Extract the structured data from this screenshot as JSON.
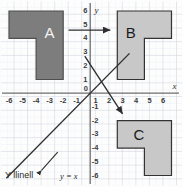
{
  "figure": {
    "width": 183,
    "height": 187
  },
  "colors": {
    "grid_minor": "#e4e8ee",
    "grid_major": "#c9d0d8",
    "axis": "#6e6e6e",
    "shape_a_fill": "#7d7d7d",
    "shape_a_stroke": "#4f4f4f",
    "shape_bc_fill": "#c8c8c8",
    "shape_bc_stroke": "#333333",
    "arrow": "#2e2e2e",
    "line_yx": "#2e2e2e",
    "text": "#2b2b2b",
    "background": "#fdfdfd"
  },
  "axes": {
    "x_label": "x",
    "y_label": "y",
    "x_ticks": [
      "-6",
      "-5",
      "-4",
      "-3",
      "-2",
      "-1",
      "0",
      "1",
      "2",
      "3",
      "4",
      "5",
      "6"
    ],
    "y_ticks": [
      "6",
      "5",
      "4",
      "3",
      "2",
      "1",
      "0",
      "-1",
      "-2",
      "-3",
      "-4",
      "-5",
      "-6"
    ],
    "x_range": [
      -6.6,
      6.6
    ],
    "y_range": [
      -6.6,
      6.6
    ],
    "origin_label": "0",
    "grid": true
  },
  "shapes": [
    {
      "label": "A",
      "name": "shape-a",
      "fill": "dark",
      "label_color": "light",
      "label_at": [
        -3.0,
        4.6
      ],
      "points": [
        [
          -6,
          6
        ],
        [
          -2,
          6
        ],
        [
          -2,
          1
        ],
        [
          -4,
          1
        ],
        [
          -4,
          4
        ],
        [
          -6,
          4
        ]
      ]
    },
    {
      "label": "B",
      "name": "shape-b",
      "fill": "light",
      "label_color": "dark",
      "label_at": [
        3.0,
        4.6
      ],
      "points": [
        [
          2,
          6
        ],
        [
          6,
          6
        ],
        [
          6,
          4
        ],
        [
          4,
          4
        ],
        [
          4,
          1
        ],
        [
          2,
          1
        ]
      ]
    },
    {
      "label": "C",
      "name": "shape-c",
      "fill": "light",
      "label_color": "dark",
      "label_at": [
        3.6,
        -3.0
      ],
      "points": [
        [
          2,
          -2
        ],
        [
          6,
          -2
        ],
        [
          6,
          -6
        ],
        [
          4,
          -6
        ],
        [
          4,
          -4
        ],
        [
          2,
          -4
        ]
      ]
    }
  ],
  "arrows": [
    {
      "name": "translation-arrow",
      "from": [
        -1.6,
        4.6
      ],
      "to": [
        1.6,
        4.6
      ]
    },
    {
      "name": "reflection-arrow",
      "from": [
        -0.4,
        2.7
      ],
      "to": [
        2.4,
        -1.5
      ]
    }
  ],
  "line": {
    "name": "line-y-equals-x",
    "equation": "y = x",
    "caption_text": "Y llinell",
    "caption_equation": "y = x",
    "from": [
      -6.2,
      -6.2
    ],
    "to": [
      2.9,
      2.9
    ]
  },
  "callout": {
    "name": "line-callout",
    "from": [
      -3.6,
      -5.6
    ],
    "to": [
      -2.4,
      -4.3
    ]
  }
}
